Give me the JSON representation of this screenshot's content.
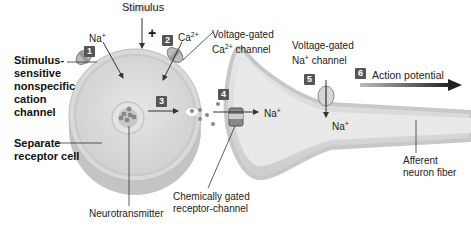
{
  "labels": {
    "stimulus": "Stimulus",
    "plus": "+",
    "na_1": "Na",
    "na_1_sup": "+",
    "ca": "Ca",
    "ca_sup": "2+",
    "voltage_ca_line1": "Voltage-gated",
    "voltage_ca_line2a": "Ca",
    "voltage_ca_line2sup": "2+",
    "voltage_ca_line2b": " channel",
    "stim_sensitive": [
      "Stimulus-",
      "sensitive",
      "nonspecific",
      "cation",
      "channel"
    ],
    "separate_receptor": [
      "Separate",
      "receptor cell"
    ],
    "neurotransmitter": "Neurotransmitter",
    "chem_gated": [
      "Chemically gated",
      "receptor-channel"
    ],
    "na_4": "Na",
    "na_4_sup": "+",
    "voltage_na_line1": "Voltage-gated",
    "voltage_na_line2a": "Na",
    "voltage_na_line2sup": "+",
    "voltage_na_line2b": " channel",
    "na_5": "Na",
    "na_5_sup": "+",
    "action_potential": "Action potential",
    "afferent": [
      "Afferent",
      "neuron fiber"
    ]
  },
  "steps": [
    "1",
    "2",
    "3",
    "4",
    "5",
    "6"
  ]
}
